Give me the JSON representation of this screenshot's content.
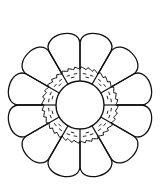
{
  "figure": {
    "petal_count": 12,
    "stroke_color": "#111111",
    "background_color": "#ffffff",
    "center": [
      80,
      105
    ],
    "inner_circle_radius": 24,
    "ring_outer_radius": 37,
    "petal_outer_radius": 74
  }
}
